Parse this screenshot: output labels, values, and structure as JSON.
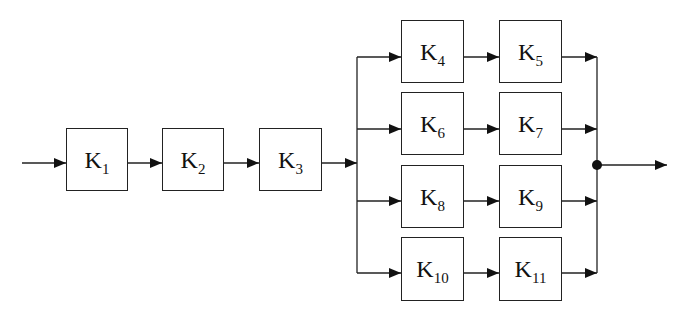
{
  "diagram": {
    "type": "block-diagram",
    "colors": {
      "stroke": "#222222",
      "background": "#ffffff"
    },
    "blocks": [
      {
        "id": "K1",
        "base": "K",
        "sub": "1",
        "x": 66,
        "y": 128,
        "w": 62,
        "h": 63
      },
      {
        "id": "K2",
        "base": "K",
        "sub": "2",
        "x": 162,
        "y": 128,
        "w": 62,
        "h": 63
      },
      {
        "id": "K3",
        "base": "K",
        "sub": "3",
        "x": 259,
        "y": 128,
        "w": 63,
        "h": 63
      },
      {
        "id": "K4",
        "base": "K",
        "sub": "4",
        "x": 401,
        "y": 20,
        "w": 63,
        "h": 63
      },
      {
        "id": "K5",
        "base": "K",
        "sub": "5",
        "x": 499,
        "y": 20,
        "w": 63,
        "h": 63
      },
      {
        "id": "K6",
        "base": "K",
        "sub": "6",
        "x": 401,
        "y": 92,
        "w": 63,
        "h": 63
      },
      {
        "id": "K7",
        "base": "K",
        "sub": "7",
        "x": 499,
        "y": 92,
        "w": 63,
        "h": 63
      },
      {
        "id": "K8",
        "base": "K",
        "sub": "8",
        "x": 401,
        "y": 165,
        "w": 63,
        "h": 63
      },
      {
        "id": "K9",
        "base": "K",
        "sub": "9",
        "x": 499,
        "y": 165,
        "w": 63,
        "h": 63
      },
      {
        "id": "K10",
        "base": "K",
        "sub": "10",
        "x": 401,
        "y": 237,
        "w": 63,
        "h": 64
      },
      {
        "id": "K11",
        "base": "K",
        "sub": "11",
        "x": 499,
        "y": 237,
        "w": 63,
        "h": 64
      }
    ],
    "edges": [
      {
        "from": "input",
        "to": "K1"
      },
      {
        "from": "K1",
        "to": "K2"
      },
      {
        "from": "K2",
        "to": "K3"
      },
      {
        "from": "K3",
        "to": "split"
      },
      {
        "from": "split",
        "to": "K4"
      },
      {
        "from": "split",
        "to": "K6"
      },
      {
        "from": "split",
        "to": "K8"
      },
      {
        "from": "split",
        "to": "K10"
      },
      {
        "from": "K4",
        "to": "K5"
      },
      {
        "from": "K6",
        "to": "K7"
      },
      {
        "from": "K8",
        "to": "K9"
      },
      {
        "from": "K10",
        "to": "K11"
      },
      {
        "from": "K5",
        "to": "junction"
      },
      {
        "from": "K7",
        "to": "junction"
      },
      {
        "from": "K9",
        "to": "junction"
      },
      {
        "from": "K11",
        "to": "junction"
      },
      {
        "from": "junction",
        "to": "output"
      }
    ]
  }
}
